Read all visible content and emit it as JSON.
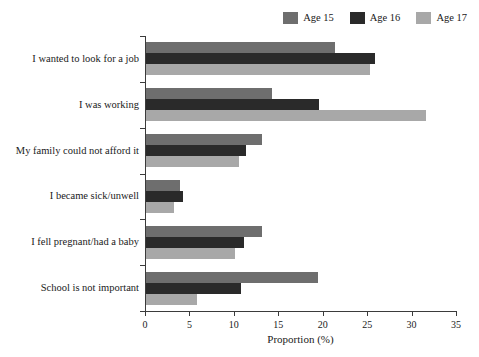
{
  "chart_data": {
    "type": "bar",
    "orientation": "horizontal",
    "title": "",
    "xlabel": "Proportion (%)",
    "ylabel": "",
    "xlim": [
      0,
      35
    ],
    "xticks": [
      0,
      5,
      10,
      15,
      20,
      25,
      30,
      35
    ],
    "xtick_labels": [
      "0",
      "5",
      "10",
      "15",
      "20",
      "25",
      "30",
      "35"
    ],
    "grid": false,
    "legend_position": "top-right",
    "categories": [
      "I wanted to look for a job",
      "I was working",
      "My family could not afford it",
      "I became sick/unwell",
      "I fell pregnant/had a baby",
      "School is not important"
    ],
    "series": [
      {
        "name": "Age 15",
        "color": "#6e6e6e",
        "values": [
          21.3,
          14.2,
          13.0,
          3.8,
          13.0,
          19.4
        ]
      },
      {
        "name": "Age 16",
        "color": "#2a2a2a",
        "values": [
          25.8,
          19.5,
          11.3,
          4.2,
          11.0,
          10.7
        ]
      },
      {
        "name": "Age 17",
        "color": "#a8a8a8",
        "values": [
          25.2,
          31.5,
          10.5,
          3.2,
          10.0,
          5.7
        ]
      }
    ]
  },
  "axis": {
    "line_color": "#3b3b3b"
  }
}
